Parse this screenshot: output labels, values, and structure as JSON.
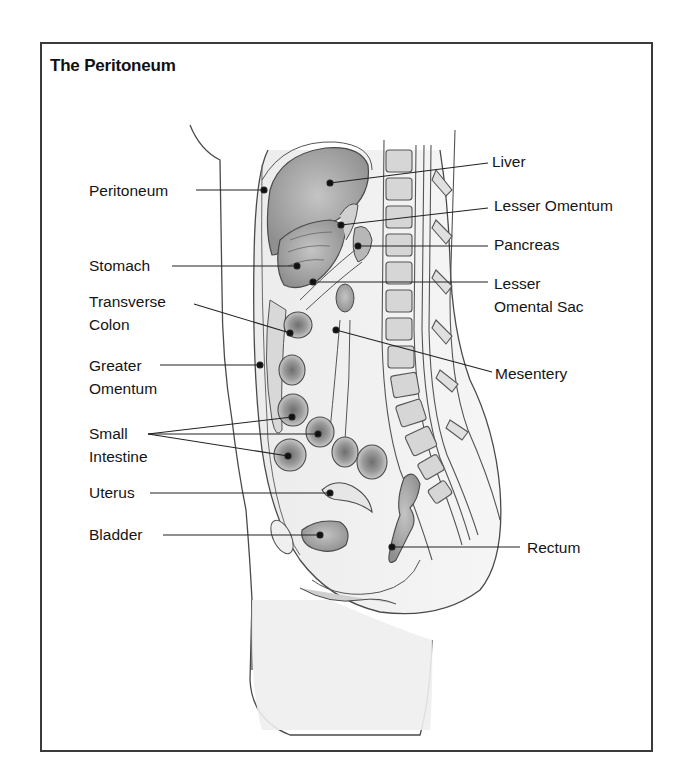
{
  "figure": {
    "title": "The Peritoneum",
    "colors": {
      "frame": "#3a3a3a",
      "text": "#151515",
      "organ_fill": "#a9a9a9",
      "tissue_fill": "#e4e4e4",
      "outline": "#4a4a4a"
    },
    "labels_left": [
      {
        "id": "peritoneum",
        "lines": [
          "Peritoneum"
        ]
      },
      {
        "id": "stomach",
        "lines": [
          "Stomach"
        ]
      },
      {
        "id": "transverse-colon",
        "lines": [
          "Transverse",
          "Colon"
        ]
      },
      {
        "id": "greater-omentum",
        "lines": [
          "Greater",
          "Omentum"
        ]
      },
      {
        "id": "small-intestine",
        "lines": [
          "Small",
          "Intestine"
        ]
      },
      {
        "id": "uterus",
        "lines": [
          "Uterus"
        ]
      },
      {
        "id": "bladder",
        "lines": [
          "Bladder"
        ]
      }
    ],
    "labels_right": [
      {
        "id": "liver",
        "lines": [
          "Liver"
        ]
      },
      {
        "id": "lesser-omentum",
        "lines": [
          "Lesser Omentum"
        ]
      },
      {
        "id": "pancreas",
        "lines": [
          "Pancreas"
        ]
      },
      {
        "id": "lesser-omental-sac",
        "lines": [
          "Lesser",
          "Omental Sac"
        ]
      },
      {
        "id": "mesentery",
        "lines": [
          "Mesentery"
        ]
      },
      {
        "id": "rectum",
        "lines": [
          "Rectum"
        ]
      }
    ]
  }
}
